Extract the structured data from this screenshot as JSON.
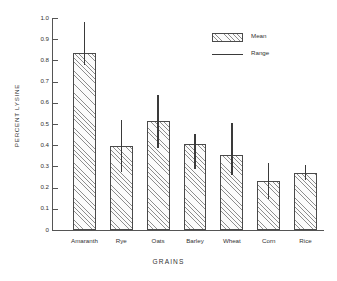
{
  "chart_data": {
    "type": "bar",
    "title": "",
    "xlabel": "GRAINS",
    "ylabel": "PERCENT LYSINE",
    "categories": [
      "Amaranth",
      "Rye",
      "Oats",
      "Barley",
      "Wheat",
      "Corn",
      "Rice"
    ],
    "values": [
      0.835,
      0.395,
      0.515,
      0.405,
      0.355,
      0.23,
      0.27
    ],
    "range_low": [
      0.78,
      0.275,
      0.385,
      0.29,
      0.26,
      0.145,
      0.235
    ],
    "range_high": [
      0.98,
      0.52,
      0.635,
      0.455,
      0.505,
      0.315,
      0.305
    ],
    "ylim": [
      0,
      1.0
    ],
    "ytick_labels": [
      "1.0",
      "0.9",
      "0.8",
      "0.7",
      "0.6",
      "0.5",
      "0.4",
      "0.3",
      "0.2",
      "0.1",
      "0"
    ],
    "ytick_values": [
      1.0,
      0.9,
      0.8,
      0.7,
      0.6,
      0.5,
      0.4,
      0.3,
      0.2,
      0.1,
      0
    ],
    "grid": false,
    "legend_position": "top-right",
    "legend": [
      {
        "label": "Mean",
        "marker": "hatched-box"
      },
      {
        "label": "Range",
        "marker": "vertical-line"
      }
    ],
    "colors": {
      "bar_edge": "#4a4a4a",
      "bar_hatch": "#8d8d8d",
      "whisker": "#3a3a3a",
      "axis": "#555555",
      "text": "#333333",
      "background": "#ffffff"
    }
  }
}
